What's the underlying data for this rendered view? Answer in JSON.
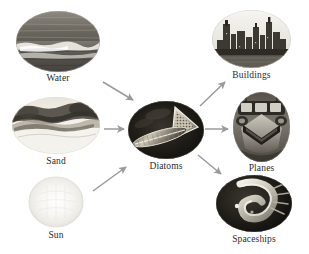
{
  "figure": {
    "type": "flow-diagram",
    "orientation": "left-to-right",
    "background_color": "#ffffff",
    "label_color": "#2b2b2b",
    "arrow_color": "#9a9a9a"
  },
  "nodes": [
    {
      "id": "water",
      "label": "Water",
      "icon": "water-ocean-photo",
      "shape": "ellipse",
      "role": "input",
      "x": 16,
      "y": 11,
      "w": 84,
      "h": 61,
      "label_y": 74,
      "palette": {
        "dark": "#4d4a44",
        "mid": "#7b776f",
        "light": "#d8d4cb",
        "highlight": "#f2efe8"
      }
    },
    {
      "id": "sand",
      "label": "Sand",
      "icon": "sand-dune-photo",
      "shape": "ellipse",
      "role": "input",
      "x": 12,
      "y": 97,
      "w": 88,
      "h": 57,
      "label_y": 157,
      "palette": {
        "dark": "#46433d",
        "mid": "#9c968b",
        "light": "#e6e2da",
        "highlight": "#fbfaf6"
      }
    },
    {
      "id": "sun",
      "label": "Sun",
      "icon": "sun-glow-photo",
      "shape": "circle",
      "role": "input",
      "x": 27,
      "y": 176,
      "w": 58,
      "h": 52,
      "label_y": 231,
      "palette": {
        "dark": "#eceae4",
        "mid": "#f4f2ee",
        "light": "#fbfaf7",
        "highlight": "#ffffff"
      }
    },
    {
      "id": "diatoms",
      "label": "Diatoms",
      "icon": "diatom-microscopy-photo",
      "shape": "ellipse",
      "role": "hub",
      "x": 128,
      "y": 101,
      "w": 76,
      "h": 58,
      "label_y": 162,
      "palette": {
        "dark": "#14120f",
        "mid": "#3d3830",
        "light": "#b9b2a4",
        "highlight": "#efece3"
      }
    },
    {
      "id": "buildings",
      "label": "Buildings",
      "icon": "city-skyline-photo",
      "shape": "ellipse",
      "role": "output",
      "x": 212,
      "y": 10,
      "w": 79,
      "h": 58,
      "label_y": 71,
      "palette": {
        "dark": "#2a2823",
        "mid": "#6e6a62",
        "light": "#ddd9d0",
        "highlight": "#f4f2ec"
      }
    },
    {
      "id": "planes",
      "label": "Planes",
      "icon": "aircraft-front-photo",
      "shape": "ellipse",
      "role": "output",
      "x": 233,
      "y": 92,
      "w": 57,
      "h": 70,
      "label_y": 164,
      "palette": {
        "dark": "#3b3831",
        "mid": "#7f7a70",
        "light": "#c8c3b8",
        "highlight": "#eeebe3"
      }
    },
    {
      "id": "spaceships",
      "label": "Spaceships",
      "icon": "spacecraft-photo",
      "shape": "ellipse",
      "role": "output",
      "x": 216,
      "y": 175,
      "w": 76,
      "h": 57,
      "label_y": 234,
      "palette": {
        "dark": "#171512",
        "mid": "#3a362f",
        "light": "#cfc9bd",
        "highlight": "#f2efe7"
      }
    }
  ],
  "edges": [
    {
      "id": "water-to-diatoms",
      "from": "Water",
      "to": "Diatoms",
      "direction": "down-right",
      "x1": 103,
      "y1": 82,
      "x2": 134,
      "y2": 100
    },
    {
      "id": "sand-to-diatoms",
      "from": "Sand",
      "to": "Diatoms",
      "direction": "right",
      "x1": 103,
      "y1": 129,
      "x2": 125,
      "y2": 129
    },
    {
      "id": "sun-to-diatoms",
      "from": "Sun",
      "to": "Diatoms",
      "direction": "up-right",
      "x1": 93,
      "y1": 190,
      "x2": 127,
      "y2": 166
    },
    {
      "id": "diatoms-to-buildings",
      "from": "Diatoms",
      "to": "Buildings",
      "direction": "up-right",
      "x1": 200,
      "y1": 106,
      "x2": 226,
      "y2": 81
    },
    {
      "id": "diatoms-to-planes",
      "from": "Diatoms",
      "to": "Planes",
      "direction": "right",
      "x1": 204,
      "y1": 129,
      "x2": 229,
      "y2": 129
    },
    {
      "id": "diatoms-to-spaceships",
      "from": "Diatoms",
      "to": "Spaceships",
      "direction": "down-right",
      "x1": 198,
      "y1": 155,
      "x2": 222,
      "y2": 175
    }
  ]
}
